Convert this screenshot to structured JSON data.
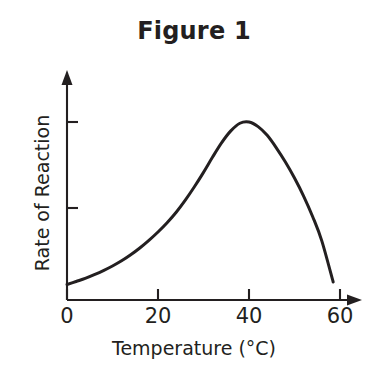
{
  "figure": {
    "title": "Figure 1"
  },
  "chart_data": {
    "type": "line",
    "title": "Figure 1",
    "subtitle": "",
    "xlabel": "Temperature (°C)",
    "ylabel": "Rate of Reaction",
    "xlim": [
      0,
      60
    ],
    "ylim": [
      0,
      118
    ],
    "grid": false,
    "legend": null,
    "legend_position": "none",
    "x_ticks": [
      0,
      20,
      40,
      60
    ],
    "x_tick_labels": [
      "0",
      "20",
      "40",
      "60"
    ],
    "y_ticks": [
      59,
      100
    ],
    "y_tick_labels": [
      "",
      ""
    ],
    "axis_arrows": {
      "x": true,
      "y": true
    },
    "series": [
      {
        "name": "Rate of Reaction",
        "color": "#231f20",
        "x": [
          0,
          2,
          4,
          6,
          8,
          10,
          12,
          14,
          16,
          18,
          20,
          22,
          24,
          26,
          28,
          30,
          32,
          34,
          36,
          38,
          40,
          42,
          44,
          46,
          48,
          50,
          52,
          54,
          56,
          58.5
        ],
        "y": [
          8.7,
          10.4,
          12.1,
          14.2,
          16.5,
          19.1,
          22.0,
          25.4,
          29.2,
          33.5,
          38.2,
          43.4,
          49.3,
          56.1,
          63.6,
          71.7,
          80.3,
          88.4,
          95.0,
          99.3,
          100.0,
          97.4,
          92.5,
          85.5,
          77.5,
          68.5,
          58.4,
          46.8,
          33.2,
          10.1
        ]
      }
    ]
  },
  "axis_labels": {
    "x_title": "Temperature (°C)",
    "y_title": "Rate of Reaction",
    "x_tick_0": "0",
    "x_tick_1": "20",
    "x_tick_2": "40",
    "x_tick_3": "60"
  },
  "colors": {
    "ink": "#231f20",
    "background": "#ffffff"
  }
}
